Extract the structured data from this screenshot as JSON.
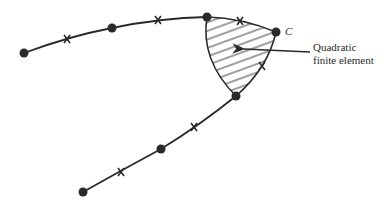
{
  "diagram": {
    "type": "finite-element-mesh-curve",
    "colors": {
      "stroke": "#2a2a2a",
      "node": "#2a2a2a",
      "hatch": "#2a2a2a",
      "background": "#ffffff"
    },
    "node_label": "C",
    "caption_lines": [
      "Quadratic",
      "finite element"
    ],
    "corner_nodes": [
      {
        "x": 24,
        "y": 53
      },
      {
        "x": 112,
        "y": 28
      },
      {
        "x": 207,
        "y": 17
      },
      {
        "x": 276,
        "y": 32
      },
      {
        "x": 236,
        "y": 96
      },
      {
        "x": 161,
        "y": 149
      },
      {
        "x": 83,
        "y": 192
      }
    ],
    "midside_nodes": [
      {
        "x": 67,
        "y": 39
      },
      {
        "x": 158,
        "y": 20
      },
      {
        "x": 240,
        "y": 21
      },
      {
        "x": 262,
        "y": 66
      },
      {
        "x": 194,
        "y": 127
      },
      {
        "x": 121,
        "y": 172
      }
    ]
  }
}
